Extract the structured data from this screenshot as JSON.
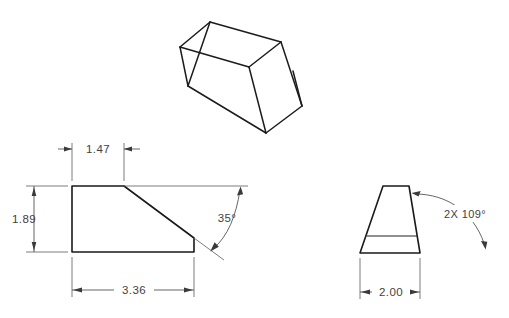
{
  "sheet": {
    "background_color": "#ffffff",
    "line_color": "#1a1a1a",
    "dim_color": "#4a4a4a",
    "title": "Wedge block engineering drawing"
  },
  "views": {
    "isometric": {
      "name": "isometric-pictorial-view",
      "description": "3D pictorial of wedge block"
    },
    "front": {
      "name": "front-view",
      "description": "Right trapezoid profile with chamfer"
    },
    "side": {
      "name": "side-view",
      "description": "Isosceles trapezoid with horizontal edge line"
    }
  },
  "dimensions": {
    "top_flat": {
      "label": "1.47",
      "view": "front"
    },
    "height": {
      "label": "1.89",
      "view": "front"
    },
    "length": {
      "label": "3.36",
      "view": "front"
    },
    "angle_front": {
      "label": "35°",
      "view": "front"
    },
    "width": {
      "label": "2.00",
      "view": "side"
    },
    "angle_side": {
      "label": "2X  109°",
      "view": "side"
    }
  }
}
